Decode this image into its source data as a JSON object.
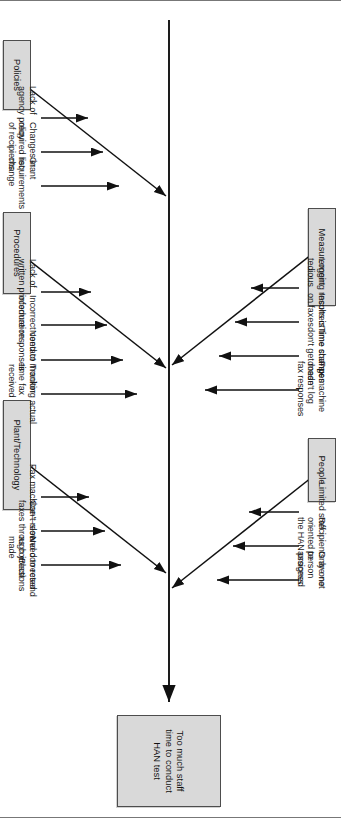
{
  "diagram": {
    "type": "fishbone",
    "orientation": "rotated-90",
    "effect": {
      "label": "Too much staff\ntime to conduct\nHAN test"
    },
    "categories": [
      {
        "id": "policies",
        "label": "Policies",
        "side": "top",
        "causes": [
          "Lack of\nagency policy",
          "Changes in\nrequired list\nof recipients",
          "Grant\nrequirements\nchange"
        ]
      },
      {
        "id": "procedures",
        "label": "Procedures",
        "side": "top",
        "causes": [
          "Lack of\nwritten procedure",
          "Incorrect contact\ninformation",
          "Need to monitor\nresponses",
          "Tracking actual\ntime fax\nreceived"
        ]
      },
      {
        "id": "plant-technology",
        "label": "Plant/Technology",
        "side": "top",
        "causes": [
          "Fax machine—slow",
          "Can't resend corrected\nfaxes through jBlast",
          "Need to resend\nas corrections\nmade"
        ]
      },
      {
        "id": "measurement",
        "label": "Measurement",
        "side": "bottom",
        "causes": [
          "Logging results is\ntedious",
          "Incorrect time stamps\non faxes",
          "Time changes\ndon't get made",
          "Fax machine\ndoesn't log\nfax responses"
        ]
      },
      {
        "id": "people",
        "label": "People",
        "side": "bottom",
        "causes": [
          "Limited staff",
          "Recipients are not\noriented to\nthe HAN process",
          "Only one\nperson\nassigned"
        ]
      }
    ],
    "colors": {
      "box_fill": "#d9d9d9",
      "box_border": "#4d4d4d",
      "line": "#111111",
      "text": "#1a1a1a",
      "background": "#ffffff"
    }
  }
}
